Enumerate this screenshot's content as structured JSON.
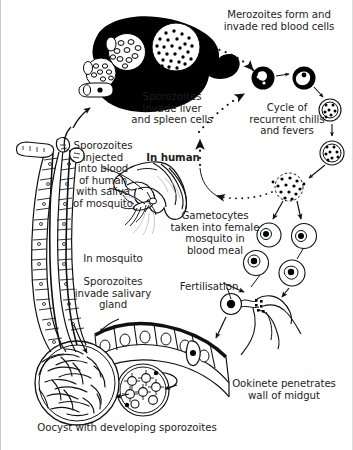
{
  "figure": {
    "background_color": "#ffffff",
    "ink_color": "#1a1a1a",
    "border_color": "#c9c9c9"
  },
  "labels": {
    "merozoites": "Merozoites form and\ninvade red blood cells",
    "sporozoites_liver": "Sporozoites\ninvade liver\nand spleen cells",
    "cycle": "Cycle of\nrecurrent chills\nand fevers",
    "sporozoites_injected": "Sporozoites\ninjected\ninto blood\nof human\nwith saliva\nof mosquito",
    "in_human": "In human",
    "gametocytes": "Gametocytes\ntaken into female\nmosquito in\nblood meal",
    "in_mosquito": "In mosquito",
    "sporozoites_salivary": "Sporozoites\ninvade salivary\ngland",
    "fertilisation": "Fertilisation",
    "ookinete": "Ookinete penetrates\nwall of midgut",
    "oocyst": "Oocyst with developing sporozoites"
  },
  "structures": {
    "liver": "liver-and-spleen-organ",
    "salivary_gland": "mosquito-salivary-gland-tube",
    "hand": "human-hand-with-mosquito",
    "mosquito": "female-anopheles-mosquito",
    "midgut": "mosquito-midgut-epithelium",
    "oocyst": "oocyst-with-sporozoites",
    "young_oocyst": "young-oocyst-cluster"
  },
  "cells": [
    {
      "name": "infected-red-blood-cell-ring-stage",
      "stage": "ring"
    },
    {
      "name": "infected-red-blood-cell-trophozoite",
      "stage": "trophozoite"
    },
    {
      "name": "infected-red-blood-cell-early-schizont",
      "stage": "early schizont"
    },
    {
      "name": "infected-red-blood-cell-late-schizont",
      "stage": "late schizont"
    },
    {
      "name": "bursting-red-blood-cell-merozoites",
      "stage": "merozoite release"
    },
    {
      "name": "macrogametocyte",
      "stage": "female gametocyte"
    },
    {
      "name": "microgametocyte",
      "stage": "male gametocyte"
    },
    {
      "name": "macrogamete",
      "stage": "female gamete"
    },
    {
      "name": "microgamete-exflagellation",
      "stage": "male gamete"
    }
  ],
  "arrows": {
    "dotted_count": 3,
    "solid_count": 12,
    "style_dotted": "dotted-arrow",
    "style_solid": "solid-arrow"
  }
}
